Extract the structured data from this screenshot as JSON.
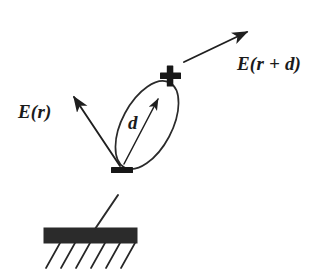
{
  "figure": {
    "domain": "physics-diagram",
    "background_color": "#ffffff",
    "ink_color": "#1b1b1b",
    "canvas": {
      "width": 330,
      "height": 280
    }
  },
  "labels": {
    "field_at_r": "E(r)",
    "field_at_r_plus_d": "E(r + d)",
    "separation_vector": "d",
    "positive_charge": "+",
    "negative_charge": "—"
  },
  "elements": {
    "dipole_ellipse": {
      "name": "dipole-body",
      "center": [
        147,
        125
      ],
      "radius_x": 25,
      "radius_y": 48,
      "rotation_deg": 28,
      "stroke": "#2a2a2a",
      "stroke_width": 1.6,
      "fill": "none"
    },
    "plus_charge": {
      "name": "positive-charge",
      "center": [
        170,
        76
      ],
      "size": 20
    },
    "minus_charge": {
      "name": "negative-charge",
      "center": [
        122,
        170
      ],
      "width": 22,
      "height": 6
    },
    "d_arrow": {
      "name": "separation-arrow",
      "from": [
        124,
        164
      ],
      "to": [
        158,
        99
      ]
    },
    "e_r_arrow": {
      "name": "field-arrow-r",
      "from": [
        120,
        166
      ],
      "to": [
        73,
        96
      ]
    },
    "e_r_plus_d_arrow": {
      "name": "field-arrow-r-plus-d",
      "from": [
        184,
        62
      ],
      "to": [
        247,
        32
      ]
    },
    "tether_line": {
      "name": "attachment-stem",
      "from": [
        118,
        195
      ],
      "to": [
        95,
        229
      ]
    },
    "ground_bar": {
      "name": "ground-bar",
      "x": 44,
      "y": 228,
      "width": 93,
      "height": 15,
      "fill": "#2b2b2b"
    },
    "ground_hatches": {
      "name": "ground-hatching",
      "count": 6,
      "top_y": 243,
      "bottom_y": 268,
      "top_x_start": 60,
      "spacing": 15,
      "dx": -14
    }
  }
}
